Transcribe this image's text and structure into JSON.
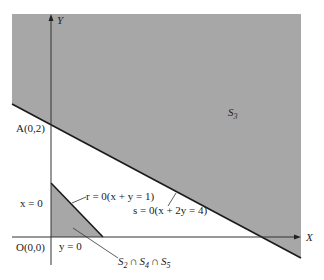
{
  "diagram": {
    "type": "feasible-region-plot",
    "colors": {
      "shaded_region": "#a7a7a7",
      "axis": "#333333",
      "boundary_line": "#1a1a1a",
      "background": "#ffffff"
    },
    "axes": {
      "x_label": "X",
      "y_label": "Y"
    },
    "points": {
      "origin": "O(0,0)",
      "a": "A(0,2)"
    },
    "region_labels": {
      "s3": {
        "main": "S",
        "sub": "3"
      },
      "intersection": {
        "parts": [
          {
            "main": "S",
            "sub": "2"
          },
          {
            "op": "∩"
          },
          {
            "main": "S",
            "sub": "4"
          },
          {
            "op": "∩"
          },
          {
            "main": "S",
            "sub": "5"
          }
        ]
      }
    },
    "line_labels": {
      "x_zero": "x = 0",
      "y_zero": "y = 0",
      "r_line": "r = 0(x + y = 1)",
      "s_line": "s = 0(x + 2y = 4)"
    }
  }
}
